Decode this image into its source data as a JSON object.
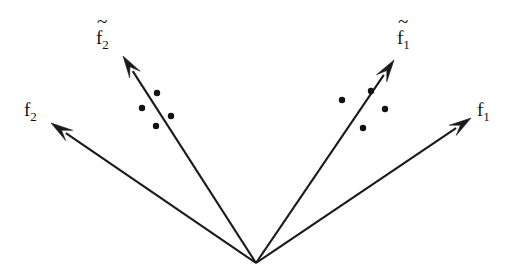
{
  "figure": {
    "width": 515,
    "height": 276,
    "background_color": "#ffffff",
    "line_color": "#1a1a1a",
    "dot_color": "#111111",
    "origin": {
      "x": 256,
      "y": 263
    }
  },
  "chart_data": {
    "type": "scatter",
    "title": "",
    "xlabel": "",
    "ylabel": "",
    "xlim": [
      0,
      515
    ],
    "ylim": [
      276,
      0
    ],
    "grid": false,
    "legend": "none",
    "coordinate_note": "pixel coordinates, y increases downward",
    "origin": {
      "x": 256,
      "y": 263
    },
    "vectors": [
      {
        "name": "f2",
        "label": "f",
        "subscript": "2",
        "tilde": false,
        "from": {
          "x": 256,
          "y": 263
        },
        "to": {
          "x": 51,
          "y": 123
        },
        "label_pos": {
          "x": 24,
          "y": 116
        }
      },
      {
        "name": "f2-tilde",
        "label": "f",
        "subscript": "2",
        "tilde": true,
        "from": {
          "x": 256,
          "y": 263
        },
        "to": {
          "x": 123,
          "y": 56
        },
        "label_pos": {
          "x": 96,
          "y": 44
        }
      },
      {
        "name": "f1-tilde",
        "label": "f",
        "subscript": "1",
        "tilde": true,
        "from": {
          "x": 256,
          "y": 263
        },
        "to": {
          "x": 394,
          "y": 60
        },
        "label_pos": {
          "x": 397,
          "y": 44
        }
      },
      {
        "name": "f1",
        "label": "f",
        "subscript": "1",
        "tilde": false,
        "from": {
          "x": 256,
          "y": 263
        },
        "to": {
          "x": 471,
          "y": 118
        },
        "label_pos": {
          "x": 477,
          "y": 116
        }
      }
    ],
    "point_clusters": [
      {
        "name": "left-cluster",
        "near_vector": "f2-tilde",
        "points": [
          {
            "x": 157,
            "y": 93
          },
          {
            "x": 142,
            "y": 108
          },
          {
            "x": 171,
            "y": 116
          },
          {
            "x": 156,
            "y": 126
          }
        ]
      },
      {
        "name": "right-cluster",
        "near_vector": "f1-tilde",
        "points": [
          {
            "x": 371,
            "y": 91
          },
          {
            "x": 342,
            "y": 100
          },
          {
            "x": 385,
            "y": 109
          },
          {
            "x": 363,
            "y": 128
          }
        ]
      }
    ],
    "point_radius": 3.2
  },
  "labels": {
    "f2": {
      "base": "f",
      "sub": "2",
      "tilde": ""
    },
    "f2_tilde": {
      "base": "f",
      "sub": "2",
      "tilde": "~"
    },
    "f1_tilde": {
      "base": "f",
      "sub": "1",
      "tilde": "~"
    },
    "f1": {
      "base": "f",
      "sub": "1",
      "tilde": ""
    }
  }
}
